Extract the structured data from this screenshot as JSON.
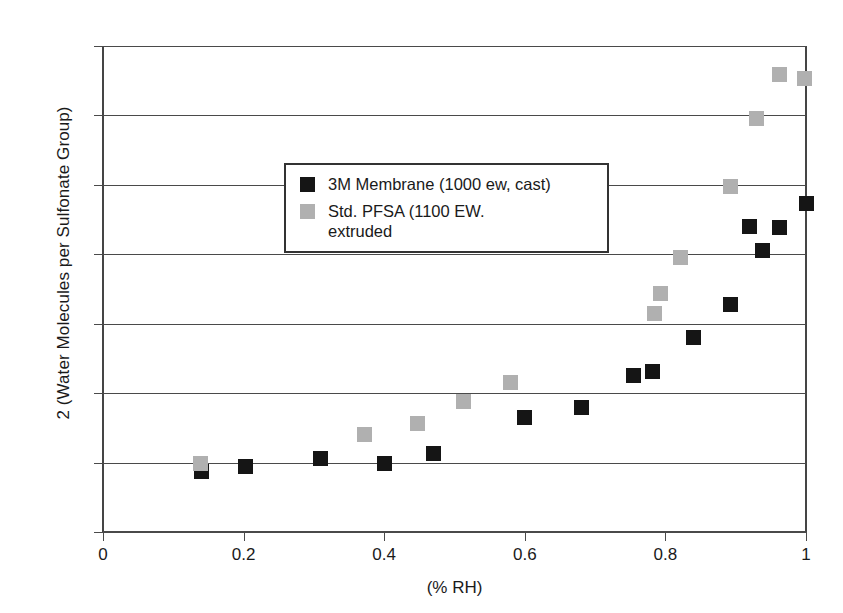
{
  "chart_data": {
    "type": "scatter",
    "title": "",
    "xlabel": "(% RH)",
    "ylabel": "2 (Water Molecules per Sulfonate Group)",
    "xlim": [
      0,
      1
    ],
    "ylim": [
      0,
      14
    ],
    "xticks": [
      "0",
      "0.2",
      "0.4",
      "0.6",
      "0.8",
      "1"
    ],
    "xtick_values": [
      0,
      0.2,
      0.4,
      0.6,
      0.8,
      1
    ],
    "yticks": [
      "0",
      "2",
      "4",
      "6",
      "8",
      "10",
      "12",
      "14"
    ],
    "ytick_values": [
      0,
      2,
      4,
      6,
      8,
      10,
      12,
      14
    ],
    "grid": "horizontal",
    "legend_position": "upper-left-inside",
    "series": [
      {
        "name": "3M Membrane (1000 ew, cast)",
        "color": "#151515",
        "marker": "square",
        "points": [
          {
            "x": 0.14,
            "y": 1.75
          },
          {
            "x": 0.203,
            "y": 1.88
          },
          {
            "x": 0.31,
            "y": 2.12
          },
          {
            "x": 0.4,
            "y": 1.98
          },
          {
            "x": 0.47,
            "y": 2.25
          },
          {
            "x": 0.6,
            "y": 3.3
          },
          {
            "x": 0.68,
            "y": 3.6
          },
          {
            "x": 0.755,
            "y": 4.5
          },
          {
            "x": 0.782,
            "y": 4.62
          },
          {
            "x": 0.84,
            "y": 5.6
          },
          {
            "x": 0.893,
            "y": 6.55
          },
          {
            "x": 0.938,
            "y": 8.1
          },
          {
            "x": 0.92,
            "y": 8.8
          },
          {
            "x": 0.962,
            "y": 8.78
          },
          {
            "x": 1.0,
            "y": 9.45
          }
        ]
      },
      {
        "name": "Std. PFSA (1100 EW.\nextruded",
        "color": "#b0b0b0",
        "marker": "square",
        "points": [
          {
            "x": 0.138,
            "y": 1.98
          },
          {
            "x": 0.372,
            "y": 2.82
          },
          {
            "x": 0.447,
            "y": 3.12
          },
          {
            "x": 0.513,
            "y": 3.75
          },
          {
            "x": 0.58,
            "y": 4.32
          },
          {
            "x": 0.785,
            "y": 6.3
          },
          {
            "x": 0.793,
            "y": 6.88
          },
          {
            "x": 0.822,
            "y": 7.9
          },
          {
            "x": 0.893,
            "y": 9.95
          },
          {
            "x": 0.93,
            "y": 11.92
          },
          {
            "x": 0.963,
            "y": 13.18
          },
          {
            "x": 0.998,
            "y": 13.05
          }
        ]
      }
    ]
  },
  "legend": {
    "entries": [
      {
        "label": "3M Membrane (1000 ew, cast)"
      },
      {
        "label": "Std. PFSA (1100 EW.\nextruded"
      }
    ]
  }
}
